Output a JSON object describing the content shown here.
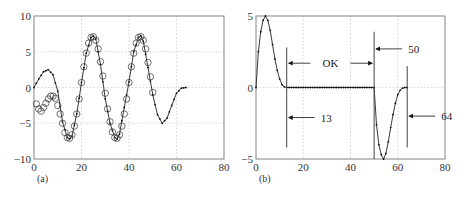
{
  "chart_data": [
    {
      "panel": "(a)",
      "type": "line",
      "title": "",
      "xlabel": "",
      "ylabel": "",
      "xlim": [
        0,
        80
      ],
      "ylim": [
        -10,
        10
      ],
      "xticks": [
        0,
        20,
        40,
        60,
        80
      ],
      "yticks": [
        10,
        5,
        0,
        -5,
        -10
      ],
      "grid": true,
      "series": [
        {
          "name": "signal (line with dots)",
          "style": "solid line with small dot markers",
          "x": [
            0,
            2,
            4,
            6,
            8,
            10,
            12,
            14,
            15,
            16,
            18,
            20,
            22,
            24,
            25,
            26,
            28,
            30,
            32,
            34,
            35,
            36,
            38,
            40,
            42,
            44,
            45,
            46,
            48,
            50,
            52,
            54,
            56,
            58,
            60,
            62,
            64
          ],
          "values": [
            0,
            1.2,
            2.2,
            2.5,
            1.8,
            -0.5,
            -4.8,
            -7.0,
            -7.2,
            -6.8,
            -3.7,
            0.7,
            4.8,
            7.0,
            7.2,
            6.8,
            3.2,
            -1.6,
            -5.0,
            -7.0,
            -7.2,
            -6.5,
            -2.8,
            0.8,
            5.0,
            7.0,
            7.2,
            6.5,
            2.8,
            -1.0,
            -3.8,
            -5.0,
            -4.3,
            -2.5,
            -0.8,
            -0.1,
            0
          ]
        },
        {
          "name": "samples (circles)",
          "style": "open circle markers",
          "x": [
            1,
            2,
            3,
            4,
            5,
            6,
            7,
            8,
            9,
            10,
            11,
            12,
            13,
            14,
            15,
            16,
            17,
            18,
            19,
            20,
            21,
            22,
            23,
            24,
            25,
            26,
            27,
            28,
            29,
            30,
            31,
            32,
            33,
            34,
            35,
            36,
            37,
            38,
            39,
            40,
            41,
            42,
            43,
            44,
            45,
            46,
            47,
            48,
            49,
            50
          ],
          "values": [
            -2.3,
            -3.0,
            -3.3,
            -2.8,
            -2.2,
            -1.6,
            -1.2,
            -1.2,
            -1.5,
            -2.5,
            -3.7,
            -5.0,
            -6.3,
            -7.0,
            -7.1,
            -6.6,
            -5.4,
            -3.7,
            -1.6,
            0.7,
            2.9,
            4.8,
            6.2,
            7.0,
            7.1,
            6.6,
            5.4,
            3.6,
            1.6,
            -0.8,
            -3.0,
            -4.8,
            -6.2,
            -7.0,
            -7.1,
            -6.6,
            -5.4,
            -3.7,
            -1.6,
            0.7,
            2.9,
            4.8,
            6.2,
            7.0,
            7.1,
            6.6,
            5.4,
            3.5,
            1.5,
            -0.7
          ]
        }
      ]
    },
    {
      "panel": "(b)",
      "type": "line",
      "title": "",
      "xlabel": "",
      "ylabel": "",
      "xlim": [
        0,
        80
      ],
      "ylim": [
        -5,
        5
      ],
      "xticks": [
        0,
        20,
        40,
        60,
        80
      ],
      "yticks": [
        5,
        0,
        -5
      ],
      "grid": true,
      "series": [
        {
          "name": "windowed signal (line with dots)",
          "style": "solid line with small dot markers",
          "x": [
            0,
            1,
            2,
            3,
            4,
            5,
            6,
            7,
            8,
            9,
            10,
            11,
            12,
            13,
            20,
            30,
            40,
            50,
            51,
            52,
            53,
            54,
            55,
            56,
            57,
            58,
            59,
            60,
            61,
            62,
            63,
            64
          ],
          "values": [
            0.0,
            2.5,
            3.9,
            4.7,
            5.0,
            4.7,
            4.0,
            3.0,
            2.0,
            1.2,
            0.6,
            0.2,
            0.05,
            0,
            0,
            0,
            0,
            0,
            -2.6,
            -4.0,
            -4.7,
            -5.0,
            -4.6,
            -3.8,
            -2.8,
            -1.9,
            -1.1,
            -0.5,
            -0.2,
            -0.05,
            0,
            0
          ]
        }
      ],
      "annotations": [
        {
          "type": "vline",
          "x": 13,
          "y_range": [
            -4.2,
            2.8
          ]
        },
        {
          "type": "vline",
          "x": 50,
          "y_range": [
            -5,
            3.9
          ]
        },
        {
          "type": "vline",
          "x": 64,
          "y_range": [
            -4.2,
            1.5
          ]
        },
        {
          "type": "arrow",
          "label": "13",
          "points_to_x": 13,
          "y": -2.1
        },
        {
          "type": "arrow",
          "label": "50",
          "points_to_x": 50,
          "y": 2.7
        },
        {
          "type": "arrow",
          "label": "64",
          "points_to_x": 64,
          "y": -2.0
        },
        {
          "type": "double-arrow",
          "label": "OK",
          "from_x": 13,
          "to_x": 50,
          "y": 1.7
        }
      ]
    }
  ],
  "figure": {
    "panel_a_label": "(a)",
    "panel_b_label": "(b)"
  }
}
